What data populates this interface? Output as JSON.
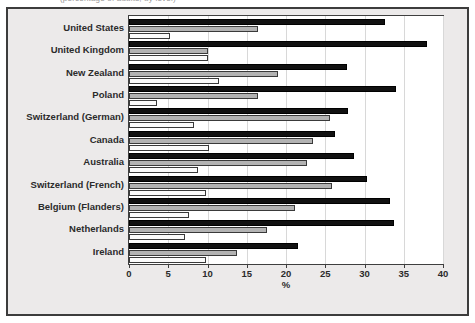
{
  "top_clipped_text": "(percentage of adults, by level)",
  "chart_data": {
    "type": "bar",
    "orientation": "horizontal",
    "title": "",
    "subtitle": "",
    "xlabel": "%",
    "ylabel": "",
    "xlim": [
      0,
      40
    ],
    "xticks": [
      0,
      5,
      10,
      15,
      20,
      25,
      30,
      35,
      40
    ],
    "xtick_labels": [
      "0",
      "5",
      "10",
      "15",
      "20",
      "25",
      "30",
      "35",
      "40"
    ],
    "grid": true,
    "grid_axis": "x",
    "legend": "none",
    "bar_colors": [
      "#111111",
      "#b3b3b3",
      "#fbfbfb"
    ],
    "categories": [
      "United States",
      "United Kingdom",
      "New Zealand",
      "Poland",
      " Switzerland (German)",
      "Canada",
      "Australia",
      "Switzerland (French)",
      "Belgium (Flanders)",
      "Netherlands",
      "Ireland"
    ],
    "series": [
      {
        "name": "series-1",
        "color": "#111111",
        "values": [
          32.6,
          38.0,
          27.8,
          34.0,
          27.9,
          26.3,
          28.7,
          30.3,
          33.3,
          33.7,
          21.5
        ]
      },
      {
        "name": "series-2",
        "color": "#b3b3b3",
        "values": [
          16.4,
          10.0,
          19.0,
          16.4,
          25.6,
          23.4,
          22.7,
          25.9,
          21.1,
          17.6,
          13.8
        ]
      },
      {
        "name": "series-3",
        "color": "#fbfbfb",
        "values": [
          5.2,
          10.0,
          11.5,
          3.6,
          8.3,
          10.2,
          8.8,
          9.8,
          7.7,
          7.1,
          9.8
        ]
      }
    ]
  }
}
